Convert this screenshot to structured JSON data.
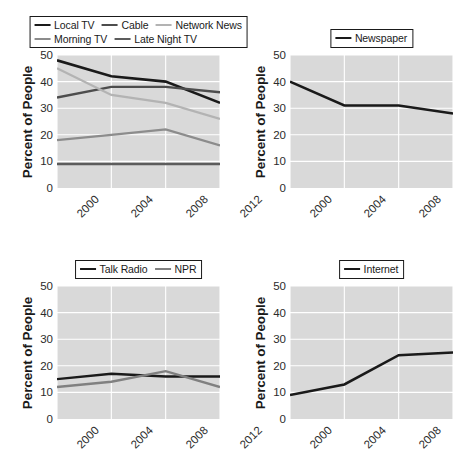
{
  "figure": {
    "width": 466,
    "height": 461,
    "background": "#ffffff",
    "plot_background": "#d9d9d9",
    "gridline_color": "#ffffff"
  },
  "axis": {
    "ylabel": "Percent of People",
    "yticks": [
      "0",
      "10",
      "20",
      "30",
      "40",
      "50"
    ],
    "ylim": [
      0,
      50
    ],
    "xticks": [
      "2000",
      "2004",
      "2008",
      "2012"
    ],
    "xlim": [
      2000,
      2012
    ]
  },
  "chart_data": [
    {
      "type": "line",
      "name": "television",
      "title": "",
      "xlabel": "",
      "ylabel": "Percent of People",
      "x": [
        2000,
        2004,
        2008,
        2012
      ],
      "categories": [
        "2000",
        "2004",
        "2008",
        "2012"
      ],
      "ylim": [
        0,
        50
      ],
      "grid": true,
      "legend_position": "above",
      "series": [
        {
          "name": "Local TV",
          "values": [
            48,
            42,
            40,
            32
          ],
          "color": "#1a1a1a",
          "width": 2.6
        },
        {
          "name": "Cable",
          "values": [
            34,
            38,
            38,
            36
          ],
          "color": "#4d4d4d",
          "width": 2.4
        },
        {
          "name": "Network News",
          "values": [
            45,
            35,
            32,
            26
          ],
          "color": "#b3b3b3",
          "width": 2.2
        },
        {
          "name": "Morning TV",
          "values": [
            18,
            20,
            22,
            16
          ],
          "color": "#8c8c8c",
          "width": 2.2
        },
        {
          "name": "Late Night TV",
          "values": [
            9,
            9,
            9,
            9
          ],
          "color": "#5c5c5c",
          "width": 2.6
        }
      ]
    },
    {
      "type": "line",
      "name": "newspaper",
      "title": "",
      "xlabel": "",
      "ylabel": "Percent of People",
      "x": [
        2000,
        2004,
        2008,
        2012
      ],
      "categories": [
        "2000",
        "2004",
        "2008",
        "2012"
      ],
      "ylim": [
        0,
        50
      ],
      "grid": true,
      "legend_position": "above",
      "series": [
        {
          "name": "Newspaper",
          "values": [
            40,
            31,
            31,
            28
          ],
          "color": "#1a1a1a",
          "width": 2.6
        }
      ]
    },
    {
      "type": "line",
      "name": "radio",
      "title": "",
      "xlabel": "",
      "ylabel": "Percent of People",
      "x": [
        2000,
        2004,
        2008,
        2012
      ],
      "categories": [
        "2000",
        "2004",
        "2008",
        "2012"
      ],
      "ylim": [
        0,
        50
      ],
      "grid": true,
      "legend_position": "above",
      "series": [
        {
          "name": "Talk Radio",
          "values": [
            15,
            17,
            16,
            16
          ],
          "color": "#1a1a1a",
          "width": 2.4
        },
        {
          "name": "NPR",
          "values": [
            12,
            14,
            18,
            12
          ],
          "color": "#808080",
          "width": 2.4
        }
      ]
    },
    {
      "type": "line",
      "name": "internet",
      "title": "",
      "xlabel": "",
      "ylabel": "Percent of People",
      "x": [
        2000,
        2004,
        2008,
        2012
      ],
      "categories": [
        "2000",
        "2004",
        "2008",
        "2012"
      ],
      "ylim": [
        0,
        50
      ],
      "grid": true,
      "legend_position": "above",
      "series": [
        {
          "name": "Internet",
          "values": [
            9,
            13,
            24,
            25
          ],
          "color": "#1a1a1a",
          "width": 2.6
        }
      ]
    }
  ]
}
